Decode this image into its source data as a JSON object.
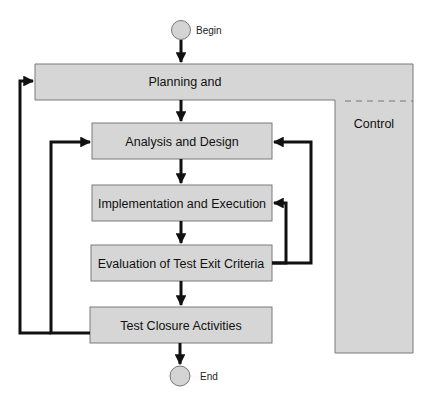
{
  "diagram": {
    "title": "",
    "colors": {
      "box_fill": "#d6d6d6",
      "box_stroke": "#7a7a7a",
      "arrow": "#111111",
      "circle_fill": "#d4d4d4",
      "circle_stroke": "#777777",
      "background": "#ffffff"
    },
    "start_node": {
      "label": "Begin",
      "shape": "circle"
    },
    "end_node": {
      "label": "End",
      "shape": "circle"
    },
    "control_frame": {
      "top_label": "Planning and",
      "side_label": "Control"
    },
    "steps": [
      {
        "id": "analysis",
        "label": "Analysis and Design"
      },
      {
        "id": "implementation",
        "label": "Implementation and Execution"
      },
      {
        "id": "evaluation",
        "label": "Evaluation of Test Exit Criteria"
      },
      {
        "id": "closure",
        "label": "Test Closure Activities"
      }
    ],
    "edges": [
      {
        "from": "Begin",
        "to": "Planning and"
      },
      {
        "from": "Planning and",
        "to": "Analysis and Design"
      },
      {
        "from": "Analysis and Design",
        "to": "Implementation and Execution"
      },
      {
        "from": "Implementation and Execution",
        "to": "Evaluation of Test Exit Criteria"
      },
      {
        "from": "Evaluation of Test Exit Criteria",
        "to": "Test Closure Activities"
      },
      {
        "from": "Test Closure Activities",
        "to": "End"
      },
      {
        "from": "Evaluation of Test Exit Criteria",
        "to": "Implementation and Execution",
        "kind": "feedback"
      },
      {
        "from": "Evaluation of Test Exit Criteria",
        "to": "Analysis and Design",
        "kind": "feedback"
      },
      {
        "from": "Test Closure Activities",
        "to": "Analysis and Design",
        "kind": "feedback"
      },
      {
        "from": "Test Closure Activities",
        "to": "Planning and",
        "kind": "feedback"
      }
    ]
  }
}
